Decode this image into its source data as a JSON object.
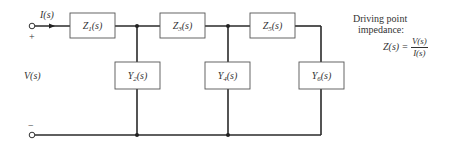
{
  "diagram": {
    "type": "ladder-network",
    "input": {
      "current_label": "I(s)",
      "voltage_label": "V(s)",
      "plus_sign": "+",
      "minus_sign": "−"
    },
    "series_elements": [
      {
        "name": "Z",
        "sub": "1",
        "suffix": "(s)"
      },
      {
        "name": "Z",
        "sub": "3",
        "suffix": "(s)"
      },
      {
        "name": "Z",
        "sub": "5",
        "suffix": "(s)"
      }
    ],
    "shunt_elements": [
      {
        "name": "Y",
        "sub": "2",
        "suffix": "(s)"
      },
      {
        "name": "Y",
        "sub": "4",
        "suffix": "(s)"
      },
      {
        "name": "Y",
        "sub": "6",
        "suffix": "(s)"
      }
    ],
    "annotation": {
      "line1": "Driving point",
      "line2": "impedance:",
      "lhs": "Z(s) =",
      "numerator": "V(s)",
      "denominator": "I(s)"
    }
  }
}
